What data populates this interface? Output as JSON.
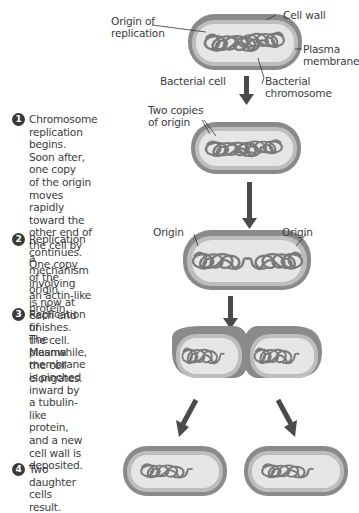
{
  "figure": {
    "labels": {
      "origin_of_replication": "Origin of\nreplication",
      "cell_wall": "Cell wall",
      "plasma_membrane": "Plasma\nmembrane",
      "bacterial_cell": "Bacterial cell",
      "bacterial_chromosome": "Bacterial\nchromosome",
      "two_copies_of_origin": "Two copies\nof origin",
      "origin_left": "Origin",
      "origin_right": "Origin"
    },
    "steps": [
      {
        "number": "1",
        "text": "Chromosome\nreplication begins.\nSoon after, one copy\nof the origin moves\nrapidly toward the\nother end of the cell by\na mechanism involving\nan actin-like protein."
      },
      {
        "number": "2",
        "text": "Replication continues.\nOne copy of the origin\nis now at each end of\nthe cell. Meanwhile,\nthe cell elongates."
      },
      {
        "number": "3",
        "text": "Replication finishes.\nThe plasma membrane\nis pinched inward by\na tubulin-like protein,\nand a new cell wall is\ndeposited."
      },
      {
        "number": "4",
        "text": "Two daughter\ncells result."
      }
    ],
    "colors": {
      "cell_wall": "#8a8a8a",
      "cell_wall_dark": "#6e6e6e",
      "membrane": "#b9b9b9",
      "cytoplasm": "#e4e4e4",
      "chromosome": "#7a7a7a",
      "arrow": "#4a4a4a",
      "text": "#3b3b3b"
    }
  }
}
